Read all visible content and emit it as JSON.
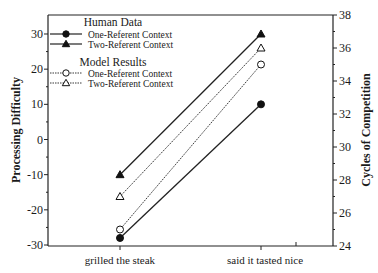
{
  "chart_data": {
    "type": "line",
    "title": "",
    "categories": [
      "grilled the steak",
      "said it tasted nice"
    ],
    "ylabel_left": "Processing Difficulty",
    "ylabel_right": "Cycles of Competition",
    "ylim_left": [
      -30,
      30
    ],
    "ylim_right": [
      24,
      38
    ],
    "yticks_left": [
      30,
      20,
      10,
      0,
      -10,
      -20,
      -30
    ],
    "yticks_right": [
      38,
      36,
      34,
      32,
      30,
      28,
      26,
      24
    ],
    "grid": false,
    "legend_position": "upper-left inside",
    "legend": {
      "groups": [
        {
          "title": "Human Data",
          "entries": [
            {
              "label": "One-Referent Context",
              "marker": "filled-circle",
              "line": "solid"
            },
            {
              "label": "Two-Referent Context",
              "marker": "filled-triangle",
              "line": "solid"
            }
          ]
        },
        {
          "title": "Model Results",
          "entries": [
            {
              "label": "One-Referent Context",
              "marker": "open-circle",
              "line": "dotted"
            },
            {
              "label": "Two-Referent Context",
              "marker": "open-triangle",
              "line": "dotted"
            }
          ]
        }
      ]
    },
    "series": [
      {
        "name": "Human Data - One-Referent Context",
        "axis": "left",
        "marker": "filled-circle",
        "line": "solid",
        "values": [
          -28,
          10
        ]
      },
      {
        "name": "Human Data - Two-Referent Context",
        "axis": "left",
        "marker": "filled-triangle",
        "line": "solid",
        "values": [
          -10,
          30
        ]
      },
      {
        "name": "Model Results - One-Referent Context",
        "axis": "right",
        "marker": "open-circle",
        "line": "dotted",
        "values": [
          25,
          35
        ]
      },
      {
        "name": "Model Results - Two-Referent Context",
        "axis": "right",
        "marker": "open-triangle",
        "line": "dotted",
        "values": [
          27,
          36
        ]
      }
    ]
  }
}
